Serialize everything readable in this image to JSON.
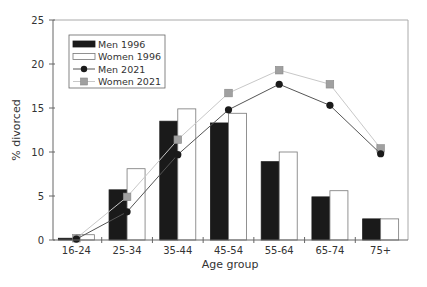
{
  "chart_data": {
    "type": "bar",
    "title": "",
    "xlabel": "Age group",
    "ylabel": "% divorced",
    "ylim": [
      0,
      25
    ],
    "yticks": [
      0,
      5,
      10,
      15,
      20,
      25
    ],
    "grid": false,
    "legend_position": "upper left (inside plot)",
    "categories": [
      "16-24",
      "25-34",
      "35-44",
      "45-54",
      "55-64",
      "65-74",
      "75+"
    ],
    "series": [
      {
        "name": "Men 1996",
        "type": "bar",
        "color": "#1a1a1a",
        "values": [
          0.2,
          5.7,
          13.5,
          13.3,
          8.9,
          4.9,
          2.4
        ]
      },
      {
        "name": "Women 1996",
        "type": "bar",
        "color": "#ffffff",
        "values": [
          0.6,
          8.1,
          14.9,
          14.4,
          10.0,
          5.6,
          2.4
        ]
      },
      {
        "name": "Men 2021",
        "type": "line",
        "marker": "circle",
        "color": "#1a1a1a",
        "line_color": "#555555",
        "values": [
          0.1,
          3.2,
          9.7,
          14.8,
          17.7,
          15.3,
          9.8
        ]
      },
      {
        "name": "Women 2021",
        "type": "line",
        "marker": "square",
        "color": "#a0a0a0",
        "line_color": "#c8c8c8",
        "values": [
          0.2,
          4.9,
          11.4,
          16.7,
          19.3,
          17.7,
          10.4
        ]
      }
    ]
  },
  "legend": {
    "items": [
      {
        "label": "Men 1996"
      },
      {
        "label": "Women 1996"
      },
      {
        "label": "Men 2021"
      },
      {
        "label": "Women 2021"
      }
    ]
  },
  "axes": {
    "xlabel": "Age group",
    "ylabel": "% divorced"
  }
}
